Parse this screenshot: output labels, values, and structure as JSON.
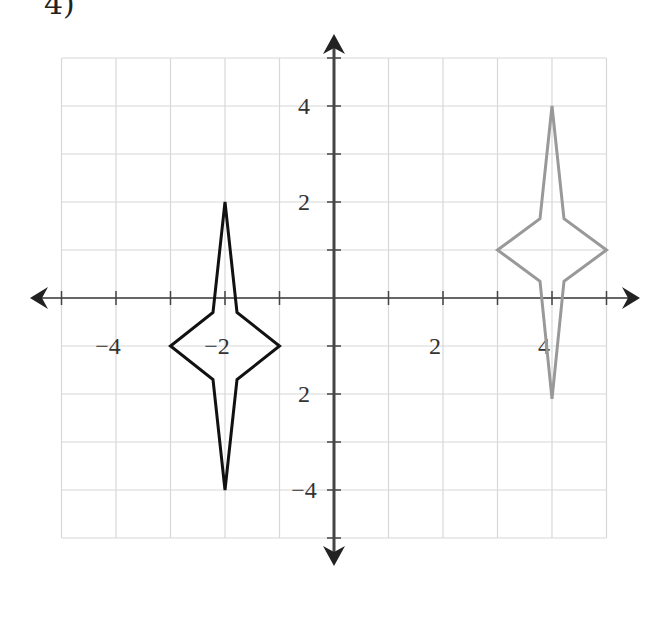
{
  "problem": {
    "label": "4)"
  },
  "chart_data": {
    "type": "line",
    "title": "",
    "xlabel": "",
    "ylabel": "",
    "xlim": [
      -5,
      5
    ],
    "ylim": [
      -5,
      5
    ],
    "grid": true,
    "x_tick_labels": [
      {
        "value": -4,
        "text": "−4"
      },
      {
        "value": -2,
        "text": "−2"
      },
      {
        "value": 2,
        "text": "2"
      },
      {
        "value": 4,
        "text": "4"
      }
    ],
    "y_tick_labels": [
      {
        "value": 4,
        "text": "4"
      },
      {
        "value": 2,
        "text": "2"
      },
      {
        "value": -2,
        "text": "2"
      },
      {
        "value": -4,
        "text": "−4"
      }
    ],
    "series": [
      {
        "name": "original-figure",
        "color": "#111111",
        "closed": true,
        "points": [
          [
            -2,
            2
          ],
          [
            -1.78,
            -0.3
          ],
          [
            -1,
            -1
          ],
          [
            -1.78,
            -1.7
          ],
          [
            -2,
            -4
          ],
          [
            -2.22,
            -1.7
          ],
          [
            -3,
            -1
          ],
          [
            -2.22,
            -0.3
          ]
        ]
      },
      {
        "name": "image-figure",
        "color": "#999999",
        "closed": true,
        "points": [
          [
            4,
            4
          ],
          [
            4.22,
            1.65
          ],
          [
            5,
            1
          ],
          [
            4.22,
            0.35
          ],
          [
            4,
            -2.1
          ],
          [
            3.78,
            0.35
          ],
          [
            3,
            1
          ],
          [
            3.78,
            1.65
          ]
        ]
      }
    ],
    "colors": {
      "grid": "#d8d8d8",
      "axis": "#333333"
    }
  }
}
